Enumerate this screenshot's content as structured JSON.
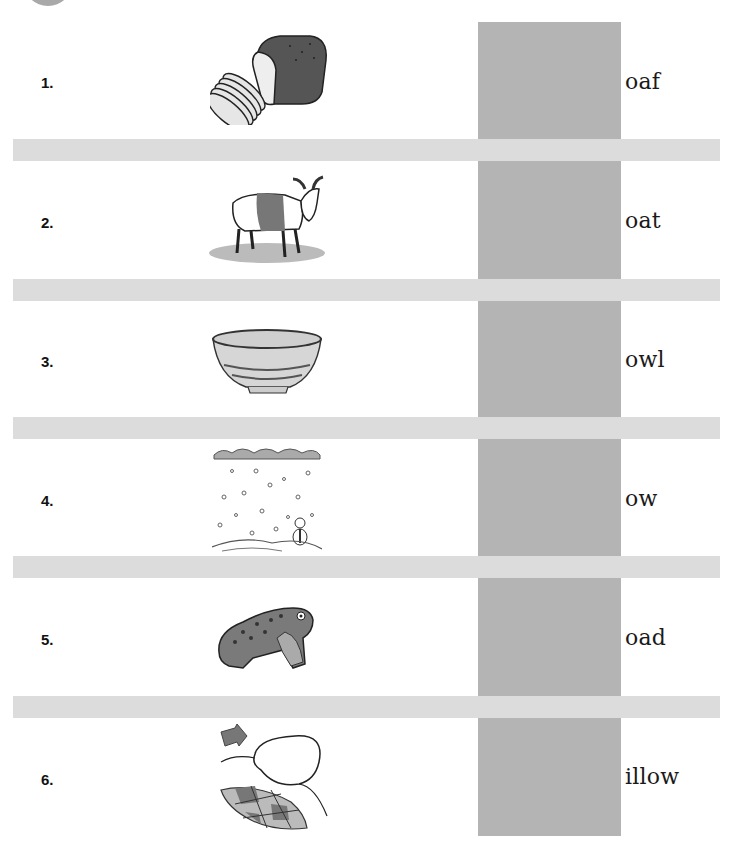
{
  "worksheet": {
    "colors": {
      "answer_column": "#b4b4b4",
      "band": "#dcdcdc",
      "corner_circle": "#a9a9a9"
    },
    "items": [
      {
        "number": "1.",
        "picture": "bread-loaf-icon",
        "word_ending": "oaf"
      },
      {
        "number": "2.",
        "picture": "goat-icon",
        "word_ending": "oat"
      },
      {
        "number": "3.",
        "picture": "bowl-icon",
        "word_ending": "owl"
      },
      {
        "number": "4.",
        "picture": "snow-scene-icon",
        "word_ending": "ow"
      },
      {
        "number": "5.",
        "picture": "toad-icon",
        "word_ending": "oad"
      },
      {
        "number": "6.",
        "picture": "pillow-icon",
        "word_ending": "illow"
      }
    ]
  }
}
